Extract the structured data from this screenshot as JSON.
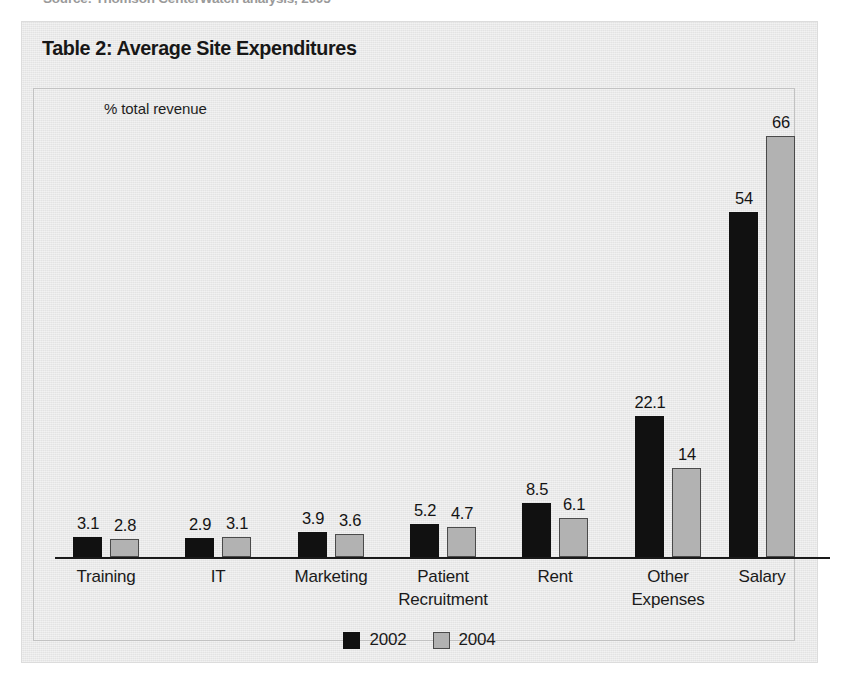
{
  "source_note": "Source: Thomson CenterWatch analysis, 2005",
  "panel": {
    "title": "Table 2: Average Site Expenditures",
    "axis_note": "% total revenue"
  },
  "legend": {
    "items": [
      {
        "label": "2002",
        "color": "#111111",
        "swatch": "swatch-2002"
      },
      {
        "label": "2004",
        "color": "#b2b2b2",
        "swatch": "swatch-2004"
      }
    ]
  },
  "chart_data": {
    "type": "bar",
    "title": "Table 2: Average Site Expenditures",
    "xlabel": "",
    "ylabel": "% total revenue",
    "ylim": [
      0,
      70
    ],
    "grid": false,
    "legend_position": "bottom",
    "annotations": [
      "% total revenue"
    ],
    "categories": [
      "Training",
      "IT",
      "Marketing",
      "Patient Recruitment",
      "Rent",
      "Other Expenses",
      "Salary"
    ],
    "category_lines": [
      [
        "Training",
        ""
      ],
      [
        "IT",
        ""
      ],
      [
        "Marketing",
        ""
      ],
      [
        "Patient",
        "Recruitment"
      ],
      [
        "Rent",
        ""
      ],
      [
        "Other",
        "Expenses"
      ],
      [
        "Salary",
        ""
      ]
    ],
    "series": [
      {
        "name": "2002",
        "color": "#111111",
        "values": [
          3.1,
          2.9,
          3.9,
          5.2,
          8.5,
          22.1,
          54
        ],
        "labels": [
          "3.1",
          "2.9",
          "3.9",
          "5.2",
          "8.5",
          "22.1",
          "54"
        ]
      },
      {
        "name": "2004",
        "color": "#b2b2b2",
        "values": [
          2.8,
          3.1,
          3.6,
          4.7,
          6.1,
          14,
          66
        ],
        "labels": [
          "2.8",
          "3.1",
          "3.6",
          "4.7",
          "6.1",
          "14",
          "66"
        ]
      }
    ]
  }
}
